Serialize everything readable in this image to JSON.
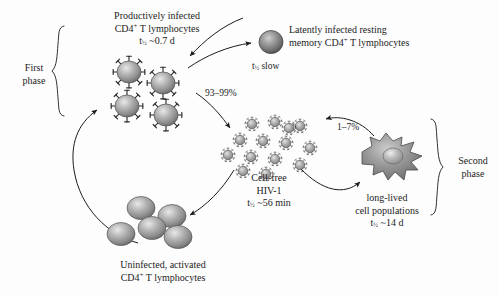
{
  "figure": {
    "kind": "hiv-replication-dynamics-diagram",
    "background_color": "#fdfdfd",
    "ink_color": "#1c1c1c"
  },
  "phases": {
    "first": {
      "label_line1": "First",
      "label_line2": "phase"
    },
    "second": {
      "label_line1": "Second",
      "label_line2": "phase"
    }
  },
  "nodes": {
    "productively_infected": {
      "line1": "Productively infected",
      "line2_pre": "CD4",
      "line2_sup": "+",
      "line2_post": " T lymphocytes",
      "halflife_pre": "t",
      "halflife_sub": "½",
      "halflife_post": " ~0.7 d",
      "cell_count": 4,
      "cell_fill": "#8f8f8f"
    },
    "latently_infected": {
      "line1": "Latently infected resting",
      "line2_pre": "memory CD4",
      "line2_sup": "+",
      "line2_post": " T lymphocytes",
      "halflife_pre": "t",
      "halflife_sub": "½",
      "halflife_post": " slow",
      "cell_count": 1,
      "cell_fill": "#6e6e6e"
    },
    "cell_free_virus": {
      "line1": "Cell-free",
      "line2": "HIV-1",
      "halflife_pre": "t",
      "halflife_sub": "½",
      "halflife_post": " ~56 min",
      "virion_count": 14,
      "virion_fill": "#9a9a9a"
    },
    "long_lived": {
      "line1": "long-lived",
      "line2": "cell populations",
      "halflife_pre": "t",
      "halflife_sub": "½",
      "halflife_post": " ~14 d",
      "cell_count": 1,
      "cell_fill": "#8a8a8a"
    },
    "uninfected": {
      "line1": "Uninfected, activated",
      "line2_pre": "CD4",
      "line2_sup": "+",
      "line2_post": " T lymphocytes",
      "cell_count": 5,
      "cell_fill": "#919191"
    }
  },
  "flows": {
    "productive_share": "93–99%",
    "longlived_share": "1–7%"
  }
}
